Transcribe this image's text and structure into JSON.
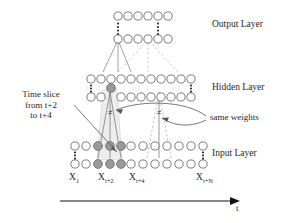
{
  "figure": {
    "type": "neural-network-architecture"
  },
  "layer_labels": {
    "output": "Output Layer",
    "hidden": "Hidden Layer",
    "input": "Input Layer"
  },
  "annotations": {
    "time_slice": {
      "line1": "Time slice",
      "line2": "from t+2",
      "line3": "to t+4"
    },
    "same_weights": "same weights"
  },
  "axis": {
    "label": "t",
    "direction": "left-to-right"
  },
  "input_tick_labels": [
    {
      "base": "X",
      "sub": "1"
    },
    {
      "base": "X",
      "sub": "t+2"
    },
    {
      "base": "X",
      "sub": "t+4"
    },
    {
      "base": "X",
      "sub": "t+N"
    }
  ],
  "layers": {
    "output": {
      "rows": 2,
      "nodes_per_row": 6,
      "ellipsis_columns": [
        0,
        4
      ]
    },
    "hidden": {
      "rows": 2,
      "nodes_per_row": 11,
      "ellipsis_columns": [
        0,
        10
      ],
      "highlighted_nodes": [
        {
          "row": 1,
          "col": 2
        }
      ]
    },
    "input": {
      "rows": 2,
      "nodes_per_row": 12,
      "ellipsis_columns": [
        0,
        11
      ],
      "highlighted_nodes": [
        {
          "row": 0,
          "col": 2
        },
        {
          "row": 0,
          "col": 3
        },
        {
          "row": 0,
          "col": 4
        },
        {
          "row": 1,
          "col": 2
        },
        {
          "row": 1,
          "col": 3
        },
        {
          "row": 1,
          "col": 4
        }
      ]
    }
  },
  "colors": {
    "node_stroke": "#6e6e6e",
    "node_fill": "#ffffff",
    "node_highlight_fill": "#9a9a9a",
    "edge_solid": "#808080",
    "edge_dashed": "#b0b0b0",
    "slice_shade": "#ececec",
    "text": "#1f1f1f",
    "axis": "#111111"
  },
  "weight_markers": [
    "≠",
    "≠"
  ]
}
